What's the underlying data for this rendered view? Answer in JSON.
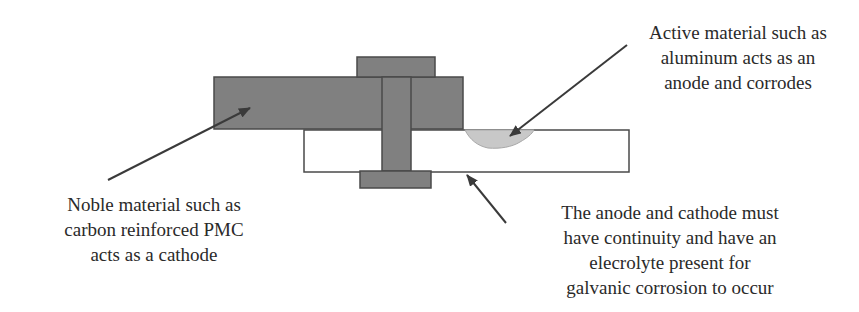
{
  "figure": {
    "colors": {
      "metal_gray": "#7f7f7f",
      "outline": "#4a4a4a",
      "corrosion": "#c8c8c8",
      "arrow": "#3a3a3a",
      "text": "#2a2a2a"
    },
    "components": {
      "cathode_plate": "Noble material (carbon reinforced PMC) plate",
      "anode_plate": "Active material (aluminum) plate",
      "bolt_head": "Bolt head",
      "bolt_shaft": "Bolt shaft",
      "nut": "Nut",
      "corrosion_pit": "Corrosion region"
    },
    "labels": {
      "anode": {
        "lines": [
          "Active material such as",
          "aluminum acts as an",
          "anode and corrodes"
        ]
      },
      "cathode": {
        "lines": [
          "Noble material such as",
          "carbon reinforced PMC",
          "acts as a cathode"
        ]
      },
      "continuity": {
        "lines": [
          "The anode and cathode must",
          "have continuity and have an",
          "elecrolyte present for",
          "galvanic corrosion to occur"
        ]
      }
    }
  }
}
